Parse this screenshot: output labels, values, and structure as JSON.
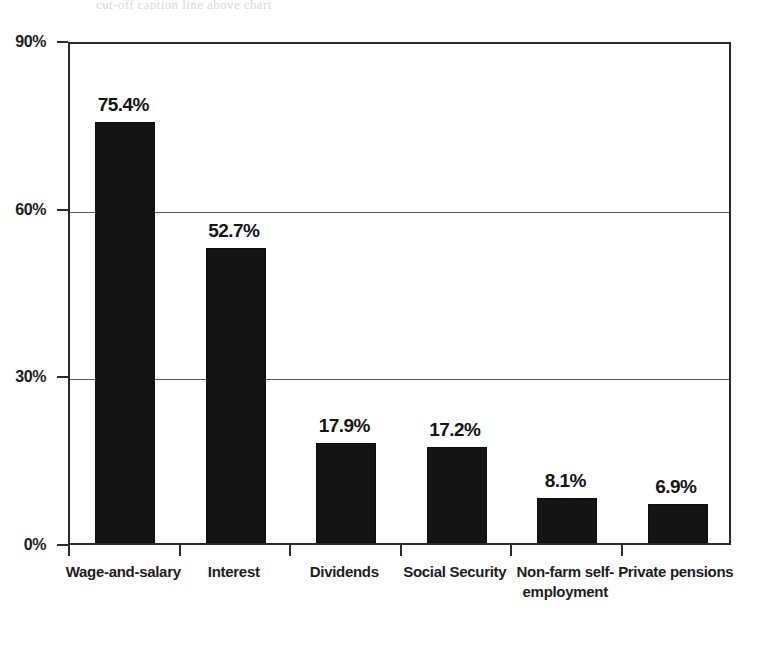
{
  "figure": {
    "top_caption_fragment": "cut-off caption line above chart"
  },
  "chart_data": {
    "type": "bar",
    "title": "",
    "subtitle": "",
    "xlabel": "",
    "ylabel": "",
    "categories": [
      "Wage-and-salary",
      "Interest",
      "Dividends",
      "Social Security",
      "Non-farm self-employment",
      "Private pensions"
    ],
    "values": [
      75.4,
      52.7,
      17.9,
      17.2,
      8.1,
      6.9
    ],
    "value_labels": [
      "75.4%",
      "52.7%",
      "17.9%",
      "17.2%",
      "8.1%",
      "6.9%"
    ],
    "ylim": [
      0,
      90
    ],
    "ytick_values": [
      0,
      30,
      60,
      90
    ],
    "ytick_labels": [
      "0%",
      "30%",
      "60%",
      "90%"
    ],
    "grid": "horizontal",
    "legend": "none",
    "bar_color": "#141414",
    "axis_color": "#2b2b2b",
    "gridline_color": "#585858",
    "background_color": "#ffffff"
  }
}
